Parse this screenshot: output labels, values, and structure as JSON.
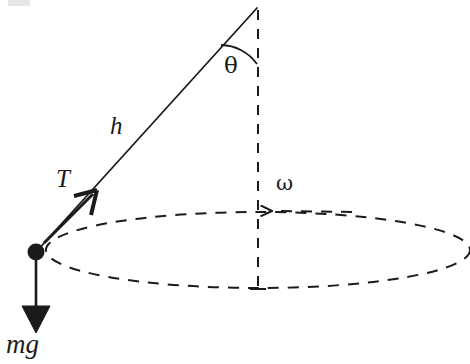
{
  "figure": {
    "type": "physics-diagram",
    "canvas": {
      "width": 470,
      "height": 364,
      "background": "#ffffff"
    },
    "ink_color": "#1b1b1b"
  },
  "labels": {
    "height": "h",
    "tension": "T",
    "weight": "mg",
    "angle": "θ",
    "angular_velocity": "ω"
  },
  "geometry": {
    "apex": {
      "x": 257,
      "y": 8
    },
    "bob": {
      "x": 36,
      "y": 252,
      "radius": 8
    },
    "axis": {
      "x": 258,
      "y_top": 10,
      "y_bottom": 290,
      "style": "dashed"
    },
    "circle_path": {
      "center_x": 258,
      "center_y": 250,
      "radius_x": 212,
      "radius_y": 38,
      "style": "dashed"
    },
    "string": {
      "from_x": 257,
      "from_y": 8,
      "to_x": 36,
      "to_y": 252
    },
    "tension_arrow": {
      "from_x": 36,
      "from_y": 252,
      "tip_x": 97,
      "tip_y": 190
    },
    "weight_arrow": {
      "from_x": 36,
      "from_y": 260,
      "tip_x": 36,
      "tip_y": 333
    },
    "omega_arrow": {
      "from_x": 330,
      "from_y": 212,
      "tip_x": 266,
      "tip_y": 211
    },
    "angle_arc": {
      "start_x": 222,
      "start_y": 45,
      "end_x": 257,
      "end_y": 64
    }
  },
  "colors": {
    "ink": "#1b1b1b",
    "background": "#ffffff",
    "artifact": "#d8d8d8"
  }
}
